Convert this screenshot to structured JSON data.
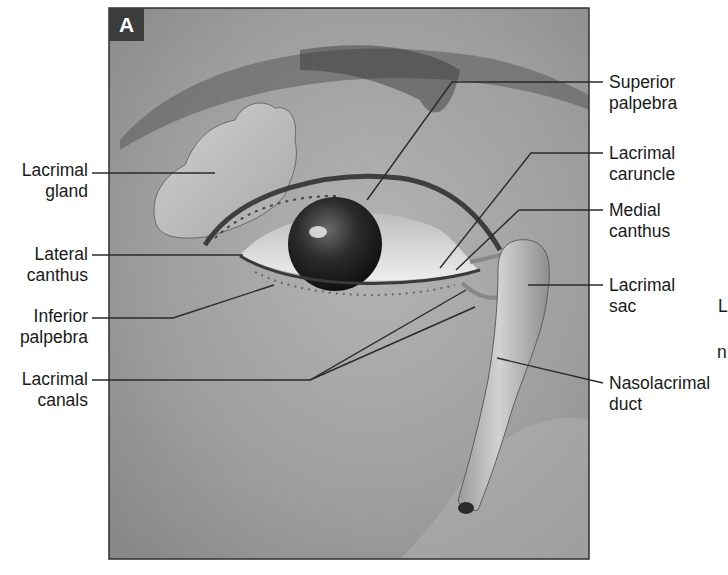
{
  "figure": {
    "panel_letter": "A",
    "colors": {
      "background": "#ffffff",
      "panel_frame": "#2e2e2e",
      "panel_fill": "#9a9a9a",
      "leader_line": "#2a2a2a",
      "label_text": "#1a1a1a"
    },
    "labels_left": [
      {
        "text": "Lacrimal\ngland",
        "x": 8,
        "y": 160
      },
      {
        "text": "Lateral\ncanthus",
        "x": 8,
        "y": 245
      },
      {
        "text": "Inferior\npalpebra",
        "x": 8,
        "y": 305
      },
      {
        "text": "Lacrimal\ncanals",
        "x": 8,
        "y": 368
      }
    ],
    "labels_right": [
      {
        "text": "Superior\npalpebra",
        "x": 609,
        "y": 75
      },
      {
        "text": "Lacrimal\ncaruncle",
        "x": 609,
        "y": 145
      },
      {
        "text": "Medial\ncanthus",
        "x": 609,
        "y": 205
      },
      {
        "text": "Lacrimal\nsac",
        "x": 609,
        "y": 275
      },
      {
        "text": "Nasolacrimal\nduct",
        "x": 609,
        "y": 382
      }
    ],
    "cropped_edge_text": [
      {
        "text": "L",
        "x": 718,
        "y": 297
      },
      {
        "text": "n",
        "x": 717,
        "y": 343
      }
    ]
  }
}
